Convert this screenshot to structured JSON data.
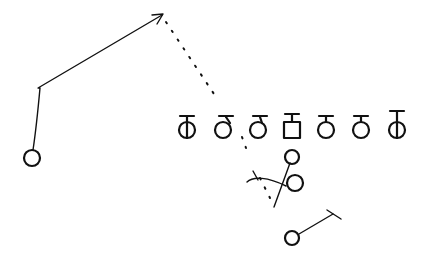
{
  "diagram": {
    "title": "",
    "ink_color": "#111111",
    "background_color": "#ffffff",
    "offensive_line": [
      {
        "id": "lt",
        "symbol": "circle-with-tee",
        "marker": "vertical-line"
      },
      {
        "id": "lg",
        "symbol": "circle-with-tee",
        "marker": "none"
      },
      {
        "id": "lg2",
        "symbol": "circle-with-tee",
        "marker": "none"
      },
      {
        "id": "c",
        "symbol": "square-with-tee",
        "marker": "none"
      },
      {
        "id": "rg",
        "symbol": "circle-with-tee",
        "marker": "none"
      },
      {
        "id": "rt",
        "symbol": "circle-with-tee",
        "marker": "none"
      },
      {
        "id": "te",
        "symbol": "circle-with-tee",
        "marker": "vertical-line"
      }
    ],
    "backs": [
      {
        "id": "qb",
        "symbol": "circle",
        "role": "quarterback"
      },
      {
        "id": "fb",
        "symbol": "circle",
        "role": "fullback"
      },
      {
        "id": "rb",
        "symbol": "circle",
        "role": "running-back"
      }
    ],
    "receivers": [
      {
        "id": "wr",
        "symbol": "circle",
        "route": "go-then-post",
        "arrow": true
      }
    ],
    "ball_path": {
      "style": "dotted",
      "from": "qb",
      "to": "wr-route-end"
    }
  }
}
